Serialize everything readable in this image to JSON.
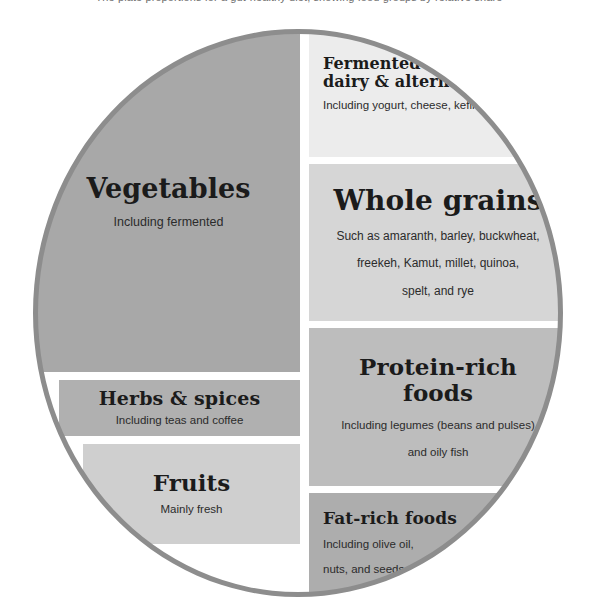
{
  "top_caption": "The plate proportions for a gut-healthy diet, showing food groups by relative share",
  "diagram": {
    "shape": "circle",
    "ring_color": "#8d8d8d",
    "background": "#ffffff",
    "segments": [
      {
        "id": "vegetables",
        "title": "Vegetables",
        "subtitle": "Including fermented",
        "color": "#a8a8a8",
        "side": "left"
      },
      {
        "id": "herbs-spices",
        "title": "Herbs & spices",
        "subtitle": "Including teas and coffee",
        "color": "#b0b0b0",
        "side": "left"
      },
      {
        "id": "fruits",
        "title": "Fruits",
        "subtitle": "Mainly fresh",
        "color": "#cfcfcf",
        "side": "left"
      },
      {
        "id": "fermented-dairy",
        "title": "Fermented\ndairy & alternatives",
        "title_line1": "Fermented",
        "title_line2": "dairy & alternatives",
        "subtitle": "Including yogurt, cheese, kefir",
        "color": "#ececec",
        "side": "right"
      },
      {
        "id": "whole-grains",
        "title": "Whole grains",
        "subtitle": "Such as amaranth, barley, buckwheat, freekeh, Kamut, millet, quinoa, spelt, and rye",
        "subtitle_line1": "Such as amaranth, barley, buckwheat,",
        "subtitle_line2": "freekeh, Kamut, millet, quinoa,",
        "subtitle_line3": "spelt, and rye",
        "color": "#d6d6d6",
        "side": "right"
      },
      {
        "id": "protein-rich",
        "title": "Protein-rich foods",
        "title_line1": "Protein-rich",
        "title_line2": "foods",
        "subtitle": "Including legumes (beans and pulses) and oily fish",
        "subtitle_line1": "Including legumes (beans and pulses)",
        "subtitle_line2": "and oily fish",
        "color": "#bdbdbd",
        "side": "right"
      },
      {
        "id": "fat-rich",
        "title": "Fat-rich foods",
        "subtitle": "Including olive oil, nuts, and seeds",
        "subtitle_line1": "Including olive oil,",
        "subtitle_line2": "nuts, and seeds",
        "color": "#adadad",
        "side": "right"
      }
    ]
  }
}
